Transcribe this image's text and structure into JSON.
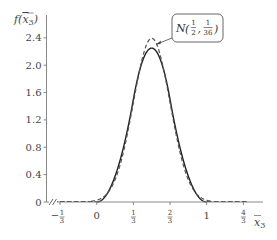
{
  "chart_data": {
    "type": "line",
    "title": "",
    "xlabel": "x̄₃",
    "ylabel": "f(x̄₃)",
    "xlim": [
      -0.45,
      1.5
    ],
    "ylim": [
      0,
      2.6
    ],
    "grid": false,
    "legend": null,
    "x_ticks": [
      {
        "value": -0.3333,
        "label": "−1/3",
        "num": "1",
        "den": "3",
        "sign": "−"
      },
      {
        "value": 0,
        "label": "0"
      },
      {
        "value": 0.3333,
        "label": "1/3",
        "num": "1",
        "den": "3",
        "sign": ""
      },
      {
        "value": 0.6667,
        "label": "2/3",
        "num": "2",
        "den": "3",
        "sign": ""
      },
      {
        "value": 1,
        "label": "1"
      },
      {
        "value": 1.3333,
        "label": "4/3",
        "num": "4",
        "den": "3",
        "sign": ""
      }
    ],
    "y_ticks": [
      {
        "value": 0,
        "label": "0"
      },
      {
        "value": 0.4,
        "label": "0.4"
      },
      {
        "value": 0.8,
        "label": "0.8"
      },
      {
        "value": 1.2,
        "label": "1.2"
      },
      {
        "value": 1.6,
        "label": "1.6"
      },
      {
        "value": 2.0,
        "label": "2.0"
      },
      {
        "value": 2.4,
        "label": "2.4"
      }
    ],
    "axis_break": "x-axis break between 0 origin and −1/3",
    "series": [
      {
        "name": "density of mean of 3 uniforms",
        "style": "solid",
        "color": "#222222",
        "x": [
          0,
          0.05,
          0.1,
          0.15,
          0.2,
          0.25,
          0.3,
          0.333,
          0.35,
          0.4,
          0.45,
          0.5,
          0.55,
          0.6,
          0.65,
          0.667,
          0.7,
          0.75,
          0.8,
          0.85,
          0.9,
          0.95,
          1.0
        ],
        "y": [
          0,
          0.0338,
          0.135,
          0.304,
          0.54,
          0.844,
          1.215,
          1.5,
          1.634,
          1.98,
          2.16,
          2.25,
          2.16,
          1.98,
          1.634,
          1.5,
          1.215,
          0.844,
          0.54,
          0.304,
          0.135,
          0.0338,
          0
        ]
      },
      {
        "name": "N(1/2, 1/36)",
        "style": "dashed",
        "color": "#555555",
        "mean": 0.5,
        "variance": 0.02778,
        "x": [
          -0.1,
          0,
          0.05,
          0.1,
          0.15,
          0.2,
          0.25,
          0.3,
          0.35,
          0.4,
          0.45,
          0.5,
          0.55,
          0.6,
          0.65,
          0.7,
          0.75,
          0.8,
          0.85,
          0.9,
          0.95,
          1.0,
          1.1
        ],
        "y": [
          0.0036,
          0.0265,
          0.0625,
          0.135,
          0.265,
          0.475,
          0.777,
          1.162,
          1.585,
          1.978,
          2.263,
          2.394,
          2.263,
          1.978,
          1.585,
          1.162,
          0.777,
          0.475,
          0.265,
          0.135,
          0.0625,
          0.0265,
          0.0036
        ]
      }
    ],
    "annotations": [
      {
        "text": "N(1/2, 1/36)",
        "target_series": "N(1/2, 1/36)",
        "arrow": true,
        "boxed": true,
        "italic_part": "N",
        "frac1_num": "1",
        "frac1_den": "2",
        "frac2_num": "1",
        "frac2_den": "36"
      }
    ]
  }
}
